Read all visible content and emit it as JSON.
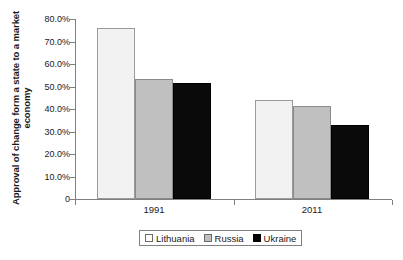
{
  "chart_data": {
    "type": "bar",
    "title": "",
    "xlabel": "",
    "ylabel": "Approval of change form a state to a market economy",
    "categories": [
      "1991",
      "2011"
    ],
    "series": [
      {
        "name": "Lithuania",
        "color": "#f2f2f2",
        "values": [
          76.0,
          44.0
        ]
      },
      {
        "name": "Russia",
        "color": "#c0c0c0",
        "values": [
          53.5,
          41.5
        ]
      },
      {
        "name": "Ukraine",
        "color": "#000000",
        "values": [
          51.5,
          33.0
        ]
      }
    ],
    "ylim": [
      0,
      80
    ],
    "ytick_labels": [
      "80.0%",
      "70.0%",
      "60.0%",
      "50.0%",
      "40.0%",
      "30.0%",
      "20.0%",
      "10.0%",
      "0"
    ],
    "ytick_values": [
      80,
      70,
      60,
      50,
      40,
      30,
      20,
      10,
      0
    ],
    "grid": false,
    "legend_position": "bottom"
  },
  "legend": {
    "entries": [
      {
        "label": "Lithuania"
      },
      {
        "label": "Russia"
      },
      {
        "label": "Ukraine"
      }
    ]
  }
}
